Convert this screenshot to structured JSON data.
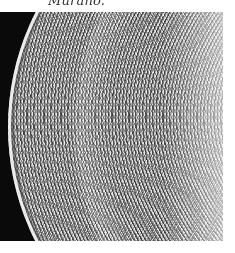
{
  "caption": "Murano.",
  "photo": {
    "subject": "close-up of Murano glass plate with lattice pattern",
    "colors": {
      "background": "#0a0a0a",
      "glass_light": "#e6e6e6",
      "glass_dark": "#6a6a6a",
      "page": "#ffffff"
    }
  }
}
